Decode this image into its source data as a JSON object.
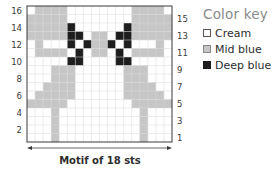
{
  "chart_data": {
    "type": "heatmap",
    "title": "",
    "columns": 18,
    "rows": 16,
    "row_labels_left": [
      "16",
      "14",
      "12",
      "10",
      "8",
      "6",
      "4",
      "2"
    ],
    "row_labels_right": [
      "15",
      "13",
      "11",
      "9",
      "7",
      "5",
      "3",
      "1"
    ],
    "legend": [
      {
        "code": "C",
        "label": "Cream",
        "color": "#ffffff"
      },
      {
        "code": "M",
        "label": "Mid blue",
        "color": "#c6c6c6"
      },
      {
        "code": "D",
        "label": "Deep blue",
        "color": "#1e1e1e"
      }
    ],
    "grid_top_to_bottom": [
      {
        "row": 16,
        "cells": "CMMMMCCCCCCCCMMMMC"
      },
      {
        "row": 15,
        "cells": "MMMMMCCCCCCCCMMMMM"
      },
      {
        "row": 14,
        "cells": "MMMMMDCCCCCCDMMMMM"
      },
      {
        "row": 13,
        "cells": "MMMMMDDCMMCDDMMMMM"
      },
      {
        "row": 12,
        "cells": "CMCCCDCDMMDCDCCCMC"
      },
      {
        "row": 11,
        "cells": "CMMMMCDCMMCDCMMMMC"
      },
      {
        "row": 10,
        "cells": "CCCCCDDCCCCDDCCCCC"
      },
      {
        "row": 9,
        "cells": "CCCMMMCCCCCCMMMCCC"
      },
      {
        "row": 8,
        "cells": "CCCMMMCCCCCCMMMCCC"
      },
      {
        "row": 7,
        "cells": "CCMMMMCCCCCCMMMMCC"
      },
      {
        "row": 6,
        "cells": "CMMMMMCCCCCCMMMMMC"
      },
      {
        "row": 5,
        "cells": "MMMMMCCCCCCCCMMMMM"
      },
      {
        "row": 4,
        "cells": "CCCMCCCCCCCCCCMCCC"
      },
      {
        "row": 3,
        "cells": "CCCMCCCCCCCCCCMCCC"
      },
      {
        "row": 2,
        "cells": "CCCMCCCCCCCCCCMCCC"
      },
      {
        "row": 1,
        "cells": "CCCMCCCCCCCCCCMCCC"
      }
    ],
    "xlabel": "Motif of 18 sts"
  },
  "legend": {
    "title": "Color key",
    "items": [
      {
        "label": "Cream",
        "color": "#ffffff"
      },
      {
        "label": "Mid blue",
        "color": "#c6c6c6"
      },
      {
        "label": "Deep blue",
        "color": "#1e1e1e"
      }
    ]
  },
  "caption": "Motif of 18 sts"
}
